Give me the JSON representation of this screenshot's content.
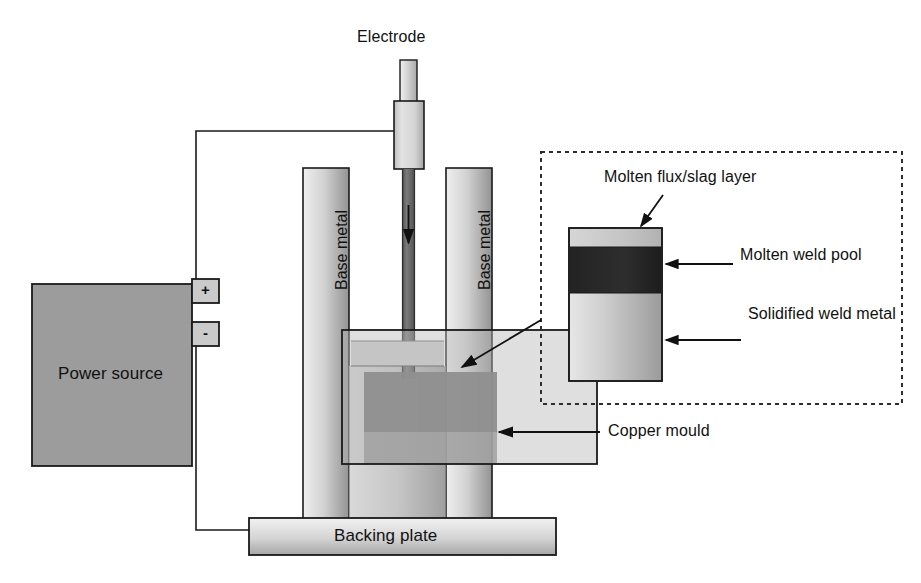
{
  "diagram": {
    "labels": {
      "electrode": "Electrode",
      "power_source": "Power source",
      "terminal_positive": "+",
      "terminal_negative": "-",
      "base_metal_left": "Base metal",
      "base_metal_right": "Base metal",
      "backing_plate": "Backing plate",
      "copper_mould": "Copper mould",
      "molten_flux": "Molten flux/slag layer",
      "molten_weld_pool": "Molten weld pool",
      "solidified_weld_metal": "Solidified weld metal"
    },
    "colors": {
      "outline": "#1a1a1a",
      "power_source_fill": "#999999",
      "terminal_fill": "#c8c8c8",
      "base_metal_light": "#e8e8e8",
      "base_metal_dark": "#9a9a9a",
      "backing_plate_light": "#efefef",
      "backing_plate_dark": "#a8a8a8",
      "electrode_light": "#d8d8d8",
      "electrode_rod_dark": "#6a6a6a",
      "mould_fill": "#b4b4b4",
      "flux_layer": "#c6c6c6",
      "weld_pool_dark": "#2b2b2b",
      "solidified_light": "#e4e4e4",
      "solidified_dark": "#9e9e9e",
      "dashed_border": "#333333",
      "background": "#ffffff"
    },
    "inset": {
      "layers": [
        {
          "name": "molten-flux-slag-layer",
          "label": "Molten flux/slag layer"
        },
        {
          "name": "molten-weld-pool",
          "label": "Molten weld pool"
        },
        {
          "name": "solidified-weld-metal",
          "label": "Solidified weld metal"
        }
      ]
    }
  }
}
